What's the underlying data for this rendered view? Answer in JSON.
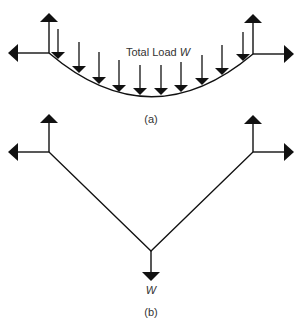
{
  "figure_a": {
    "load_label": "Total Load",
    "load_symbol": "W",
    "caption": "(a)",
    "load_arrow_count": 10
  },
  "figure_b": {
    "load_symbol": "W",
    "caption": "(b)"
  },
  "colors": {
    "ink": "#111111",
    "background": "#ffffff"
  }
}
